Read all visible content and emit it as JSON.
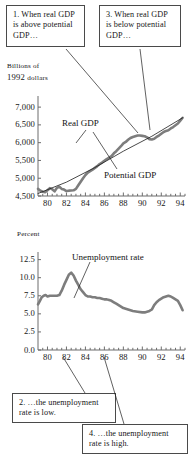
{
  "figure": {
    "callouts": [
      {
        "id": "callout-1",
        "text": "1. When real GDP is above potential GDP…"
      },
      {
        "id": "callout-3",
        "text": "3. When real GDP is below potential GDP…"
      },
      {
        "id": "callout-2",
        "text": "2. …the unemployment rate is low."
      },
      {
        "id": "callout-4",
        "text": "4. …the unemployment rate is high."
      }
    ],
    "top_units_line1": "Billions of",
    "top_units_line2a": "1992 ",
    "top_units_line2b": "dollars",
    "bottom_units": "Percent",
    "series_label_real": "Real GDP",
    "series_label_potential": "Potential GDP",
    "series_label_unemployment": "Unemployment rate",
    "line_color": "#7d7d7d",
    "thin_line_color": "#1c1c1c",
    "axis_color": "#6d6d6d",
    "callout_border": "#4a4a4a"
  },
  "chart_data": [
    {
      "type": "line",
      "title": "Real GDP and Potential GDP",
      "xlabel": "",
      "ylabel": "Billions of 1992 dollars",
      "xlim": [
        79,
        94.5
      ],
      "ylim": [
        4500,
        7200
      ],
      "yticks": [
        7000,
        6500,
        6000,
        5500,
        5000,
        4500
      ],
      "ytick_labels": [
        "7,000",
        "6,500",
        "6,000",
        "5,500",
        "5,000",
        "4,500"
      ],
      "xticks": [
        80,
        82,
        84,
        86,
        88,
        90,
        92,
        94
      ],
      "xtick_labels": [
        "80",
        "82",
        "84",
        "86",
        "88",
        "90",
        "92",
        "94"
      ],
      "xminor_step": 0.5,
      "grid": false,
      "legend": "inline-annotation",
      "series": [
        {
          "name": "Real GDP",
          "x": [
            79.0,
            79.25,
            79.5,
            79.75,
            80.0,
            80.25,
            80.5,
            80.75,
            81.0,
            81.25,
            81.5,
            81.75,
            82.0,
            82.25,
            82.5,
            82.75,
            83.0,
            83.25,
            83.5,
            83.75,
            84.0,
            84.25,
            84.5,
            84.75,
            85.0,
            85.25,
            85.5,
            85.75,
            86.0,
            86.25,
            86.5,
            86.75,
            87.0,
            87.25,
            87.5,
            87.75,
            88.0,
            88.25,
            88.5,
            88.75,
            89.0,
            89.25,
            89.5,
            89.75,
            90.0,
            90.25,
            90.5,
            90.75,
            91.0,
            91.25,
            91.5,
            91.75,
            92.0,
            92.25,
            92.5,
            92.75,
            93.0,
            93.25,
            93.5,
            93.75,
            94.0,
            94.25
          ],
          "y": [
            4700,
            4650,
            4620,
            4610,
            4660,
            4720,
            4690,
            4630,
            4730,
            4760,
            4700,
            4680,
            4640,
            4650,
            4655,
            4660,
            4700,
            4800,
            4900,
            5000,
            5090,
            5160,
            5200,
            5240,
            5290,
            5340,
            5400,
            5440,
            5490,
            5540,
            5580,
            5620,
            5700,
            5760,
            5830,
            5900,
            5980,
            6020,
            6080,
            6130,
            6160,
            6180,
            6200,
            6200,
            6190,
            6180,
            6150,
            6100,
            6090,
            6110,
            6160,
            6200,
            6250,
            6300,
            6330,
            6350,
            6400,
            6440,
            6490,
            6540,
            6620,
            6700
          ]
        },
        {
          "name": "Potential GDP",
          "x": [
            79.0,
            82.0,
            85.0,
            88.0,
            91.0,
            94.25
          ],
          "y": [
            4570,
            4890,
            5300,
            5760,
            6180,
            6700
          ]
        }
      ]
    },
    {
      "type": "line",
      "title": "Unemployment rate",
      "xlabel": "",
      "ylabel": "Percent",
      "xlim": [
        79,
        94.5
      ],
      "ylim": [
        0.0,
        13.0
      ],
      "yticks": [
        12.5,
        10.0,
        7.5,
        5.0,
        2.5,
        0.0
      ],
      "ytick_labels": [
        "12.5",
        "10.0",
        "7.5",
        "5.0",
        "2.5",
        "0.0"
      ],
      "xticks": [
        80,
        82,
        84,
        86,
        88,
        90,
        92,
        94
      ],
      "xtick_labels": [
        "80",
        "82",
        "84",
        "86",
        "88",
        "90",
        "92",
        "94"
      ],
      "xminor_step": 0.5,
      "grid": false,
      "legend": "inline-annotation",
      "series": [
        {
          "name": "Unemployment rate",
          "x": [
            79.0,
            79.2,
            79.4,
            79.6,
            79.8,
            80.0,
            80.25,
            80.5,
            80.75,
            81.0,
            81.25,
            81.5,
            81.75,
            82.0,
            82.25,
            82.5,
            82.75,
            83.0,
            83.25,
            83.5,
            83.75,
            84.0,
            84.25,
            84.5,
            84.75,
            85.0,
            85.25,
            85.5,
            85.75,
            86.0,
            86.25,
            86.5,
            86.75,
            87.0,
            87.25,
            87.5,
            87.75,
            88.0,
            88.5,
            89.0,
            89.5,
            90.0,
            90.25,
            90.5,
            90.75,
            91.0,
            91.25,
            91.5,
            91.75,
            92.0,
            92.25,
            92.5,
            92.75,
            93.0,
            93.25,
            93.5,
            93.75,
            94.0,
            94.25
          ],
          "y": [
            6.3,
            6.8,
            7.3,
            7.5,
            7.6,
            7.4,
            7.5,
            7.5,
            7.5,
            7.5,
            7.6,
            8.2,
            9.0,
            9.7,
            10.4,
            10.7,
            10.3,
            9.6,
            9.0,
            8.4,
            8.0,
            7.6,
            7.4,
            7.4,
            7.3,
            7.3,
            7.2,
            7.2,
            7.1,
            7.0,
            7.0,
            6.9,
            6.8,
            6.6,
            6.4,
            6.2,
            6.0,
            5.8,
            5.6,
            5.4,
            5.3,
            5.2,
            5.2,
            5.3,
            5.4,
            5.6,
            6.2,
            6.6,
            6.9,
            7.1,
            7.3,
            7.4,
            7.5,
            7.4,
            7.2,
            7.0,
            6.8,
            6.2,
            5.5
          ]
        }
      ]
    }
  ]
}
